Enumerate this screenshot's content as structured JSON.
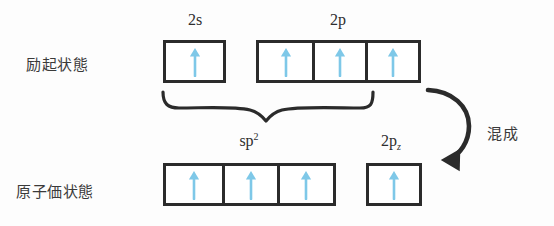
{
  "figure": {
    "background_color": "#fdfdfd",
    "line_color": "#2b2b2b",
    "arrow_color": "#7ec8e8",
    "text_color": "#2e2e2e"
  },
  "row_labels": {
    "excited_state": "励起状態",
    "valence_state": "原子価状態"
  },
  "orbital_labels": {
    "two_s": "2s",
    "two_p": "2p",
    "sp2_base": "sp",
    "sp2_sup": "2",
    "two_pz_base": "2p",
    "two_pz_sub": "z"
  },
  "annotations": {
    "hybridization": "混成"
  },
  "top_row": {
    "name": "excited-state-row",
    "groups": [
      {
        "name": "2s",
        "label": "2s",
        "boxes": [
          {
            "electron": "up-arrow",
            "count": 1
          }
        ]
      },
      {
        "name": "2p",
        "label": "2p",
        "boxes": [
          {
            "electron": "up-arrow",
            "count": 1
          },
          {
            "electron": "up-arrow",
            "count": 1
          },
          {
            "electron": "up-arrow",
            "count": 1
          }
        ]
      }
    ]
  },
  "bottom_row": {
    "name": "valence-state-row",
    "groups": [
      {
        "name": "sp2",
        "label": "sp2",
        "boxes": [
          {
            "electron": "up-arrow",
            "count": 1
          },
          {
            "electron": "up-arrow",
            "count": 1
          },
          {
            "electron": "up-arrow",
            "count": 1
          }
        ]
      },
      {
        "name": "2pz",
        "label": "2pz",
        "boxes": [
          {
            "electron": "up-arrow",
            "count": 1
          }
        ]
      }
    ]
  },
  "connectors": {
    "brace": "curly-brace-down",
    "curved_arrow": "curved-arrow-down-left"
  }
}
